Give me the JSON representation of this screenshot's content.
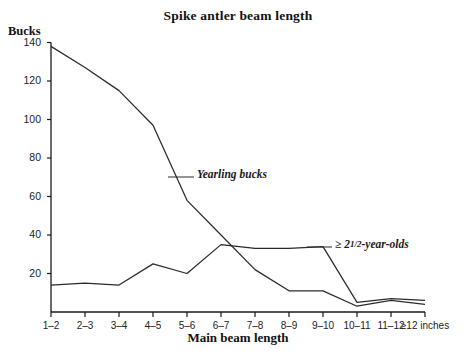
{
  "chart_data": {
    "type": "line",
    "title": "Spike antler beam length",
    "xlabel": "Main beam length",
    "ylabel": "Bucks",
    "categories": [
      "1–2",
      "2–3",
      "3–4",
      "4–5",
      "5–6",
      "6–7",
      "7–8",
      "8–9",
      "9–10",
      "10–11",
      "11–12",
      "≥12 inches"
    ],
    "ylim": [
      0,
      140
    ],
    "yticks": [
      20,
      40,
      60,
      80,
      100,
      120,
      140
    ],
    "xlim_labels_note": "categorical bins in inches",
    "grid": false,
    "legend": "inline annotations",
    "series": [
      {
        "name": "Yearling bucks",
        "values": [
          138,
          127,
          115,
          97,
          58,
          40,
          22,
          11,
          11,
          3,
          6,
          4
        ],
        "annotation": "Yearling bucks",
        "color": "#2b2b2b"
      },
      {
        "name": "≥ 2½-year-olds",
        "values": [
          14,
          15,
          14,
          25,
          20,
          35,
          33,
          33,
          34,
          5,
          7,
          6
        ],
        "annotation_prefix": "≥ 2",
        "annotation_fraction": "1/2",
        "annotation_suffix": "-year-olds",
        "color": "#2b2b2b"
      }
    ]
  },
  "annotations": {
    "yearling": "Yearling bucks",
    "older_prefix": "≥ 2",
    "older_frac_num": "1",
    "older_frac_den": "2",
    "older_suffix": "-year-olds"
  },
  "axis": {
    "y_ticks": [
      "20",
      "40",
      "60",
      "80",
      "100",
      "120",
      "140"
    ],
    "x_ticks": [
      "1–2",
      "2–3",
      "3–4",
      "4–5",
      "5–6",
      "6–7",
      "7–8",
      "8–9",
      "9–10",
      "10–11",
      "11–12",
      "≥12 inches"
    ]
  },
  "colors": {
    "line": "#2b2b2b",
    "axis": "#1a1a1a",
    "text": "#1a1a1a",
    "background": "#ffffff"
  }
}
